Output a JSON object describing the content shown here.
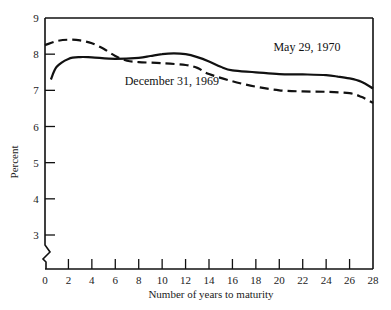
{
  "chart_data": {
    "type": "line",
    "title": "",
    "xlabel": "Number of years to maturity",
    "ylabel": "Percent",
    "xlim": [
      0,
      28
    ],
    "ylim": [
      3,
      9
    ],
    "y_axis_break": true,
    "grid": false,
    "x_ticks": [
      0,
      2,
      4,
      6,
      8,
      10,
      12,
      14,
      16,
      18,
      20,
      22,
      24,
      26,
      28
    ],
    "y_ticks": [
      3,
      4,
      5,
      6,
      7,
      8,
      9
    ],
    "legend": "inline labels",
    "series": [
      {
        "name": "May 29, 1970",
        "style": "solid",
        "x": [
          0.5,
          1,
          2,
          3,
          4,
          6,
          8,
          9,
          10,
          11,
          12,
          13,
          14,
          15,
          16,
          18,
          20,
          22,
          24,
          25,
          26,
          27,
          28
        ],
        "values": [
          7.3,
          7.65,
          7.87,
          7.92,
          7.91,
          7.87,
          7.9,
          7.95,
          8.0,
          8.02,
          8.0,
          7.92,
          7.8,
          7.65,
          7.55,
          7.5,
          7.45,
          7.44,
          7.42,
          7.38,
          7.33,
          7.24,
          7.05
        ],
        "label_position": {
          "x": 19.5,
          "y": 8.1
        }
      },
      {
        "name": "December 31, 1969",
        "style": "dashed",
        "x": [
          0,
          1,
          2,
          3,
          4,
          5,
          6,
          7,
          8,
          10,
          12,
          13,
          14,
          16,
          18,
          20,
          22,
          24,
          26,
          27,
          28
        ],
        "values": [
          8.25,
          8.36,
          8.4,
          8.38,
          8.3,
          8.15,
          7.95,
          7.82,
          7.78,
          7.75,
          7.7,
          7.62,
          7.45,
          7.25,
          7.1,
          7.0,
          6.97,
          6.96,
          6.92,
          6.82,
          6.65
        ],
        "label_position": {
          "x": 6.8,
          "y": 7.15
        }
      }
    ]
  },
  "axes": {
    "x_label": "Number of years to maturity",
    "y_label": "Percent"
  }
}
